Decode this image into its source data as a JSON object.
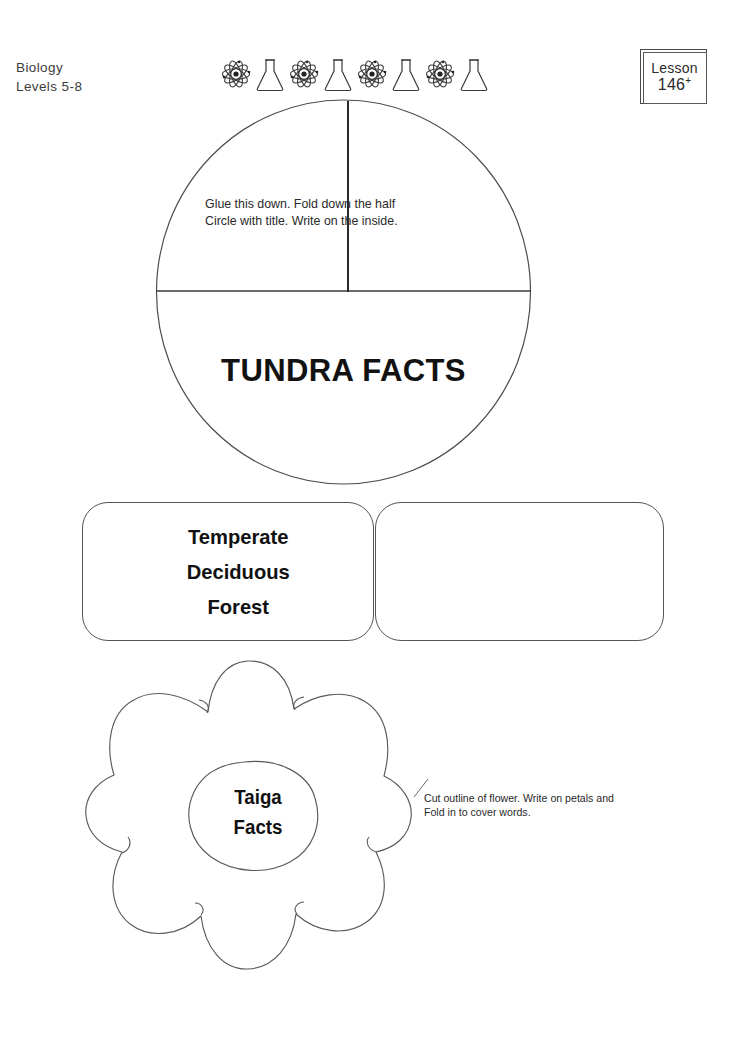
{
  "header": {
    "subject": "Biology",
    "levels": "Levels 5-8",
    "lesson_word": "Lesson",
    "lesson_number": "146",
    "lesson_suffix": "+",
    "icons": [
      "atom-icon",
      "flask-icon",
      "atom-icon",
      "flask-icon",
      "atom-icon",
      "flask-icon",
      "atom-icon",
      "flask-icon"
    ]
  },
  "circle_foldable": {
    "instruction_line1": "Glue this down. Fold down the half",
    "instruction_line2": "Circle with title. Write on the inside.",
    "title": "TUNDRA FACTS"
  },
  "boxes": {
    "left_label_line1": "Temperate",
    "left_label_line2": "Deciduous",
    "left_label_line3": "Forest",
    "right_label": ""
  },
  "flower_foldable": {
    "center_line1": "Taiga",
    "center_line2": "Facts",
    "instruction_line1": "Cut outline of flower. Write on petals and",
    "instruction_line2": "Fold in to cover words."
  },
  "colors": {
    "ink": "#1a1a1a",
    "outline": "#555555",
    "page_background": "#ffffff"
  }
}
